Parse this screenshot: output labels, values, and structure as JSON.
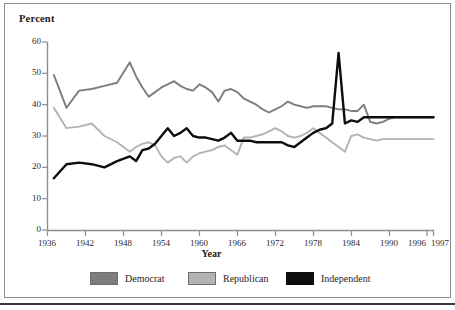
{
  "figure": {
    "y_axis_title": "Percent",
    "x_axis_title": "Year"
  },
  "legend": {
    "democrat_label": "Democrat",
    "republican_label": "Republican",
    "independent_label": "Independent"
  },
  "colors": {
    "democrat": "#7d7d7d",
    "republican": "#b3b3b3",
    "independent": "#0d0d0d",
    "axis": "#8d8d8d",
    "frame": "#8d8d8d",
    "text": "#1a1a1a",
    "background": "#ffffff"
  },
  "chart_data": {
    "type": "line",
    "title": "",
    "xlabel": "Year",
    "ylabel": "Percent",
    "xlim": [
      1936,
      1997
    ],
    "ylim": [
      0,
      60
    ],
    "yticks": [
      0,
      10,
      20,
      30,
      40,
      50,
      60
    ],
    "xticks": [
      1936,
      1942,
      1948,
      1954,
      1960,
      1966,
      1972,
      1978,
      1984,
      1990,
      1996,
      1997
    ],
    "grid": false,
    "legend_position": "bottom",
    "x": [
      1937,
      1939,
      1941,
      1943,
      1945,
      1947,
      1949,
      1950,
      1951,
      1952,
      1953,
      1954,
      1955,
      1956,
      1957,
      1958,
      1959,
      1960,
      1961,
      1962,
      1963,
      1964,
      1965,
      1966,
      1967,
      1968,
      1969,
      1970,
      1971,
      1972,
      1973,
      1974,
      1975,
      1976,
      1977,
      1978,
      1979,
      1980,
      1981,
      1982,
      1983,
      1984,
      1985,
      1986,
      1987,
      1988,
      1989,
      1990,
      1991,
      1992,
      1993,
      1994,
      1995,
      1996,
      1997
    ],
    "series": [
      {
        "name": "Democrat",
        "color": "#7d7d7d",
        "values": [
          49.5,
          39.0,
          44.5,
          45.0,
          46.0,
          47.0,
          53.5,
          49.0,
          45.5,
          42.5,
          44.0,
          45.5,
          46.5,
          47.5,
          46.0,
          45.0,
          44.5,
          46.5,
          45.5,
          44.0,
          41.0,
          44.5,
          45.0,
          44.0,
          42.0,
          41.0,
          40.0,
          38.5,
          37.5,
          38.5,
          39.5,
          41.0,
          40.0,
          39.5,
          39.0,
          39.5,
          39.5,
          39.5,
          39.0,
          38.5,
          38.5,
          38.0,
          38.0,
          40.0,
          34.5,
          34.0,
          34.5,
          35.5,
          36.0,
          36.0,
          36.0,
          36.0,
          36.0,
          36.0,
          36.0
        ],
        "labels_visible": false
      },
      {
        "name": "Republican",
        "color": "#b3b3b3",
        "values": [
          39.0,
          32.5,
          33.0,
          34.0,
          30.0,
          28.0,
          25.0,
          26.5,
          27.5,
          28.0,
          27.0,
          23.5,
          21.5,
          23.0,
          23.5,
          21.5,
          23.5,
          24.5,
          25.0,
          25.5,
          26.5,
          27.0,
          25.5,
          24.0,
          29.5,
          29.5,
          30.0,
          30.5,
          31.5,
          32.5,
          31.5,
          30.0,
          29.5,
          30.0,
          31.0,
          32.5,
          31.0,
          29.5,
          28.0,
          26.5,
          25.0,
          30.0,
          30.5,
          29.5,
          29.0,
          28.5,
          29.0,
          29.0,
          29.0,
          29.0,
          29.0,
          29.0,
          29.0,
          29.0,
          29.0
        ],
        "labels_visible": false
      },
      {
        "name": "Independent",
        "color": "#0d0d0d",
        "values": [
          16.5,
          21.0,
          21.5,
          21.0,
          20.0,
          22.0,
          23.5,
          22.0,
          25.5,
          26.0,
          27.5,
          30.0,
          32.5,
          30.0,
          31.0,
          32.5,
          30.0,
          29.5,
          29.5,
          29.0,
          28.5,
          29.5,
          31.0,
          28.5,
          28.5,
          28.5,
          28.0,
          28.0,
          28.0,
          28.0,
          28.0,
          27.0,
          26.5,
          28.0,
          29.5,
          31.0,
          32.0,
          32.5,
          34.0,
          56.5,
          34.0,
          35.0,
          34.5,
          36.0,
          36.0,
          36.0,
          36.0,
          36.0,
          36.0,
          36.0,
          36.0,
          36.0,
          36.0,
          36.0,
          36.0
        ],
        "labels_visible": false,
        "note": "sharp spike in 1992"
      }
    ]
  }
}
